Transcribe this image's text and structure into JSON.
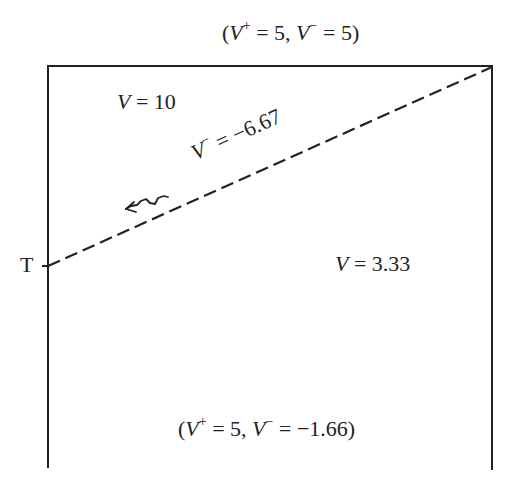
{
  "diagram": {
    "type": "potential-regions",
    "colors": {
      "line": "#222222",
      "background": "#ffffff"
    },
    "boundary_top": {
      "label_prefix": "(",
      "v_plus_symbol": "V",
      "v_plus_sup": "+",
      "v_plus_value": " = 5, ",
      "v_minus_symbol": "V",
      "v_minus_sup": "−",
      "v_minus_value": " = 5)"
    },
    "boundary_bottom": {
      "label_prefix": "(",
      "v_plus_symbol": "V",
      "v_plus_sup": "+",
      "v_plus_value": " = 5, ",
      "v_minus_symbol": "V",
      "v_minus_sup": "−",
      "v_minus_value": " = −1.66)"
    },
    "region_upper": {
      "symbol": "V",
      "value": " = 10"
    },
    "region_lower": {
      "symbol": "V",
      "value": " = 3.33"
    },
    "discontinuity_line": {
      "symbol": "V",
      "sup": "−",
      "value": " = −6.67",
      "style": "dashed"
    },
    "point_t": {
      "label": "T"
    },
    "wave_arrow": {
      "icon": "wavy-arrow-icon",
      "direction": "left"
    }
  }
}
